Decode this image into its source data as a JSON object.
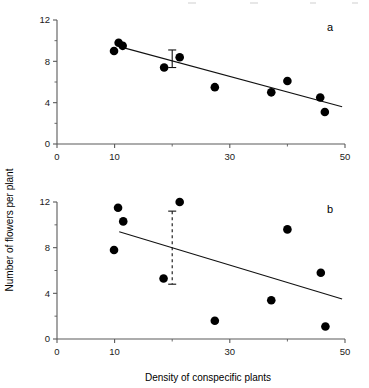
{
  "figure": {
    "xlabel": "Density of conspecific plants",
    "ylabel": "Number of flowers per plant"
  },
  "chart_data": [
    {
      "type": "scatter",
      "panel": "a",
      "title": "",
      "xlabel": "Density of conspecific plants",
      "ylabel": "Number of flowers per plant",
      "xlim": [
        0,
        50
      ],
      "ylim": [
        0,
        12
      ],
      "xticks": [
        0,
        10,
        30,
        50
      ],
      "xtick_labels": [
        "0",
        "10",
        "30",
        "50"
      ],
      "yticks": [
        0,
        4,
        8,
        12
      ],
      "ytick_labels": [
        "0",
        "4",
        "8",
        "12"
      ],
      "grid": false,
      "legend": null,
      "points": [
        {
          "x": 9.9,
          "y": 9.0
        },
        {
          "x": 10.7,
          "y": 9.8
        },
        {
          "x": 11.4,
          "y": 9.5
        },
        {
          "x": 18.6,
          "y": 7.4
        },
        {
          "x": 21.3,
          "y": 8.4
        },
        {
          "x": 27.4,
          "y": 5.5
        },
        {
          "x": 37.2,
          "y": 5.0
        },
        {
          "x": 40.0,
          "y": 6.1
        },
        {
          "x": 45.7,
          "y": 4.5
        },
        {
          "x": 46.5,
          "y": 3.1
        }
      ],
      "fit_line": {
        "x0": 11.0,
        "y0": 9.4,
        "x1": 49.5,
        "y1": 3.6
      },
      "error_bar": {
        "x": 20.0,
        "center": 8.3,
        "upper": 9.1,
        "lower": 7.4,
        "style": "solid"
      }
    },
    {
      "type": "scatter",
      "panel": "b",
      "title": "",
      "xlabel": "Density of conspecific plants",
      "ylabel": "Number of flowers per plant",
      "xlim": [
        0,
        50
      ],
      "ylim": [
        0,
        12
      ],
      "xticks": [
        0,
        10,
        30,
        50
      ],
      "xtick_labels": [
        "0",
        "10",
        "30",
        "50"
      ],
      "yticks": [
        0,
        4,
        8,
        12
      ],
      "ytick_labels": [
        "0",
        "4",
        "8",
        "12"
      ],
      "grid": false,
      "legend": null,
      "points": [
        {
          "x": 9.9,
          "y": 7.8
        },
        {
          "x": 10.6,
          "y": 11.5
        },
        {
          "x": 11.5,
          "y": 10.3
        },
        {
          "x": 18.5,
          "y": 5.3
        },
        {
          "x": 21.3,
          "y": 12.0
        },
        {
          "x": 27.4,
          "y": 1.6
        },
        {
          "x": 37.2,
          "y": 3.4
        },
        {
          "x": 40.0,
          "y": 9.6
        },
        {
          "x": 45.8,
          "y": 5.8
        },
        {
          "x": 46.6,
          "y": 1.1
        }
      ],
      "fit_line": {
        "x0": 10.8,
        "y0": 9.4,
        "x1": 49.5,
        "y1": 3.5
      },
      "error_bar": {
        "x": 20.0,
        "center": 8.0,
        "upper": 11.2,
        "lower": 4.8,
        "style": "dashed"
      }
    }
  ],
  "panels": {
    "a": {
      "label": "a"
    },
    "b": {
      "label": "b"
    }
  }
}
